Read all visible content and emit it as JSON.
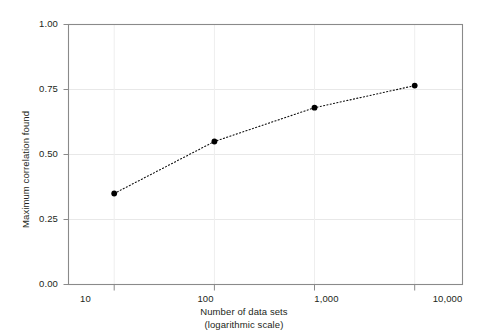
{
  "chart_data": {
    "type": "line",
    "title": "",
    "subtitle": "",
    "xlabel": "Number of data sets",
    "xlabel_line2": "(logarithmic scale)",
    "ylabel": "Maximum correlation found",
    "x_scale": "log",
    "x": [
      10,
      100,
      1000,
      10000
    ],
    "xtick_labels": [
      "10",
      "100",
      "1,000",
      "10,000"
    ],
    "values": [
      0.35,
      0.55,
      0.68,
      0.765
    ],
    "ytick_labels": [
      "0.00",
      "0.25",
      "0.50",
      "0.75",
      "1.00"
    ],
    "yticks": [
      0.0,
      0.25,
      0.5,
      0.75,
      1.0
    ],
    "ylim": [
      0.0,
      1.0
    ],
    "xlim": [
      3.5,
      30000
    ],
    "grid": true,
    "legend": "none",
    "series": [
      {
        "name": "Maximum correlation found",
        "values": [
          0.35,
          0.55,
          0.68,
          0.765
        ],
        "marker": "circle",
        "marker_color": "#000000",
        "line_style": "dotted",
        "line_color": "#000000"
      }
    ],
    "colors": {
      "axis": "#808080",
      "grid": "#e8e8e8",
      "marker": "#000000",
      "line": "#000000",
      "text": "#231f20",
      "background": "#ffffff"
    }
  }
}
